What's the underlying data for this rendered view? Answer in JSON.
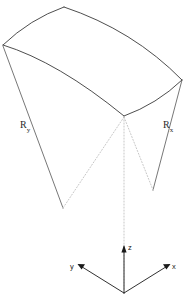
{
  "figure": {
    "background_color": "#ffffff",
    "stroke_color": "#3a3a3a",
    "dotted_color": "#b9b9b9",
    "axis_color": "#1a1a1a",
    "labels": {
      "radius_y": "R",
      "radius_y_sub": "y",
      "radius_x": "R",
      "radius_x_sub": "x",
      "axis_z": "z",
      "axis_x": "x",
      "axis_y": "y"
    },
    "geometry": {
      "surface_corners": {
        "left": [
          3,
          45
        ],
        "top": [
          64,
          7
        ],
        "right": [
          182,
          80
        ],
        "bottom": [
          124,
          116
        ]
      },
      "center_of_curvature_y": [
        63,
        208
      ],
      "center_of_curvature_x": [
        153,
        190
      ],
      "origin": [
        124,
        293
      ],
      "axis_z_tip": [
        124,
        246
      ],
      "axis_x_tip": [
        168,
        265
      ],
      "axis_y_tip": [
        80,
        265
      ]
    }
  }
}
